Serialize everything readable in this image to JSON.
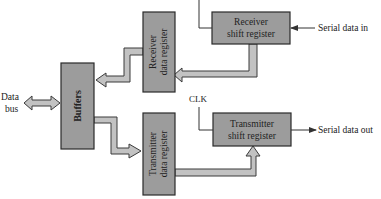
{
  "diagram": {
    "type": "block-diagram",
    "colors": {
      "block_fill": "#9c9c9c",
      "block_stroke": "#2a2a2a",
      "arrow_fill": "#c2c2c2",
      "arrow_stroke": "#3a3a3a",
      "line": "#333333",
      "text": "#222222"
    },
    "labels": {
      "data_bus_line1": "Data",
      "data_bus_line2": "bus",
      "buffers": "Buffers",
      "receiver_data_register_line1": "Receiver",
      "receiver_data_register_line2": "data register",
      "transmitter_data_register_line1": "Transmitter",
      "transmitter_data_register_line2": "data register",
      "receiver_shift_register_line1": "Receiver",
      "receiver_shift_register_line2": "shift register",
      "transmitter_shift_register_line1": "Transmitter",
      "transmitter_shift_register_line2": "shift register",
      "serial_data_in": "Serial data in",
      "serial_data_out": "Serial data out",
      "clk": "CLK"
    },
    "blocks": [
      {
        "id": "buffers",
        "label": "Buffers"
      },
      {
        "id": "receiver-data-register",
        "label": "Receiver data register"
      },
      {
        "id": "transmitter-data-register",
        "label": "Transmitter data register"
      },
      {
        "id": "receiver-shift-register",
        "label": "Receiver shift register"
      },
      {
        "id": "transmitter-shift-register",
        "label": "Transmitter shift register"
      }
    ],
    "connections": [
      {
        "from": "Data bus",
        "to": "buffers",
        "kind": "bidirectional bus"
      },
      {
        "from": "receiver-shift-register",
        "to": "receiver-data-register",
        "kind": "parallel bus"
      },
      {
        "from": "receiver-data-register",
        "to": "buffers",
        "kind": "parallel bus"
      },
      {
        "from": "buffers",
        "to": "transmitter-data-register",
        "kind": "parallel bus"
      },
      {
        "from": "transmitter-data-register",
        "to": "transmitter-shift-register",
        "kind": "parallel bus"
      },
      {
        "from": "Serial data in",
        "to": "receiver-shift-register",
        "kind": "serial line"
      },
      {
        "from": "transmitter-shift-register",
        "to": "Serial data out",
        "kind": "serial line"
      },
      {
        "from": "CLK",
        "to": "receiver-shift-register",
        "kind": "clock line"
      },
      {
        "from": "CLK",
        "to": "transmitter-shift-register",
        "kind": "clock line"
      }
    ]
  }
}
